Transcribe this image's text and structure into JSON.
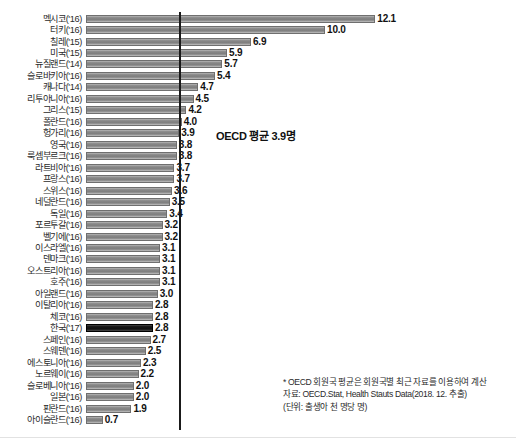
{
  "chart_data": {
    "type": "bar",
    "orientation": "horizontal",
    "title": "",
    "xlabel": "",
    "ylabel": "",
    "xlim": [
      0,
      12.8
    ],
    "grid": false,
    "legend": false,
    "categories": [
      "멕시코('16)",
      "터키('16)",
      "칠레('15)",
      "미국('15)",
      "뉴질랜드('14)",
      "슬로바키아('16)",
      "캐나다('14)",
      "리투아니아('16)",
      "그리스('15)",
      "폴란드('16)",
      "헝가리('16)",
      "영국('16)",
      "룩셈부르크('16)",
      "라트비아('16)",
      "프랑스('16)",
      "스위스('16)",
      "네덜란드('16)",
      "독일('16)",
      "포르투갈('16)",
      "벨기에('16)",
      "이스라엘('16)",
      "덴마크('16)",
      "오스트리아('16)",
      "호주('16)",
      "아일랜드('16)",
      "이탈리아('16)",
      "체코('16)",
      "한국('17)",
      "스페인('16)",
      "스웨덴('16)",
      "에스토니아('16)",
      "노르웨이('16)",
      "슬로베니아('16)",
      "일본('16)",
      "핀란드('16)",
      "아이슬란드('16)"
    ],
    "values": [
      12.1,
      10.0,
      6.9,
      5.9,
      5.7,
      5.4,
      4.7,
      4.5,
      4.2,
      4.0,
      3.9,
      3.8,
      3.8,
      3.7,
      3.7,
      3.6,
      3.5,
      3.4,
      3.2,
      3.2,
      3.1,
      3.1,
      3.1,
      3.1,
      3.0,
      2.8,
      2.8,
      2.8,
      2.7,
      2.5,
      2.3,
      2.2,
      2.0,
      2.0,
      1.9,
      0.7
    ],
    "value_labels": [
      "12.1",
      "10.0",
      "6.9",
      "5.9",
      "5.7",
      "5.4",
      "4.7",
      "4.5",
      "4.2",
      "4.0",
      "3.9",
      "3.8",
      "3.8",
      "3.7",
      "3.7",
      "3.6",
      "3.5",
      "3.4",
      "3.2",
      "3.2",
      "3.1",
      "3.1",
      "3.1",
      "3.1",
      "3.0",
      "2.8",
      "2.8",
      "2.8",
      "2.7",
      "2.5",
      "2.3",
      "2.2",
      "2.0",
      "2.0",
      "1.9",
      "0.7"
    ],
    "highlight_index": 27,
    "reference_line": {
      "value": 3.9,
      "label": "OECD 평균 3.9명"
    },
    "colors": {
      "bar": "#8f8f8f",
      "bar_border": "#6f6f6f",
      "highlight_bar": "#1d1d1d",
      "reference_line": "#1a1a1a",
      "text": "#1a1a1a",
      "background": "#ffffff"
    }
  },
  "footnote": {
    "line1": "* OECD 회원국 평균은 회원국별 최근 자료를 이용하여 계산",
    "line2": "자료: OECD.Stat, Health Stauts Data(2018. 12. 추출)",
    "line3": "(단위: 출생아 천 명당 명)"
  }
}
